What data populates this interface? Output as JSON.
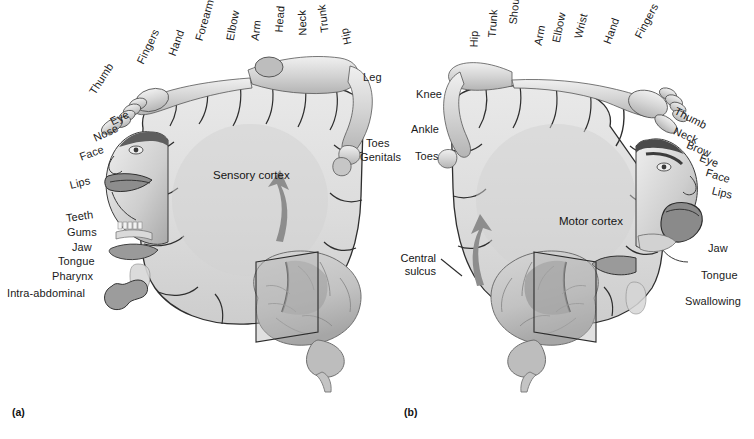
{
  "figure": {
    "background_color": "#ffffff",
    "width": 754,
    "height": 439
  },
  "panels": [
    {
      "id": "a",
      "letter": "(a)",
      "cortex_label": "Sensory cortex",
      "labels_top": [
        {
          "text": "Thumb",
          "x": 92,
          "y": 88,
          "rot": -57
        },
        {
          "text": "Fingers",
          "x": 140,
          "y": 58,
          "rot": -64
        },
        {
          "text": "Hand",
          "x": 172,
          "y": 50,
          "rot": -70
        },
        {
          "text": "Forearm",
          "x": 199,
          "y": 35,
          "rot": -74
        },
        {
          "text": "Elbow",
          "x": 230,
          "y": 35,
          "rot": -79
        },
        {
          "text": "Arm",
          "x": 255,
          "y": 35,
          "rot": -83
        },
        {
          "text": "Head",
          "x": 279,
          "y": 27,
          "rot": -86
        },
        {
          "text": "Neck",
          "x": 303,
          "y": 30,
          "rot": -92
        },
        {
          "text": "Trunk",
          "x": 325,
          "y": 27,
          "rot": -97
        },
        {
          "text": "Hip",
          "x": 348,
          "y": 39,
          "rot": -103
        }
      ],
      "labels_left": [
        {
          "text": "Eye",
          "x": 111,
          "y": 117,
          "rot": -27
        },
        {
          "text": "Nose",
          "x": 94,
          "y": 133,
          "rot": -24
        },
        {
          "text": "Face",
          "x": 80,
          "y": 152,
          "rot": -20
        },
        {
          "text": "Lips",
          "x": 70,
          "y": 180,
          "rot": -14
        },
        {
          "text": "Teeth",
          "x": 66,
          "y": 213,
          "rot": -8
        },
        {
          "text": "Gums",
          "x": 67,
          "y": 227,
          "rot": 0
        },
        {
          "text": "Jaw",
          "x": 72,
          "y": 242,
          "rot": 0
        },
        {
          "text": "Tongue",
          "x": 58,
          "y": 256,
          "rot": 0
        },
        {
          "text": "Pharynx",
          "x": 52,
          "y": 271,
          "rot": 0
        },
        {
          "text": "Intra-abdominal",
          "x": 7,
          "y": 288,
          "rot": 0
        }
      ],
      "labels_right": [
        {
          "text": "Leg",
          "x": 363,
          "y": 72,
          "rot": 0
        },
        {
          "text": "Toes",
          "x": 366,
          "y": 138,
          "rot": 0
        },
        {
          "text": "Genitals",
          "x": 360,
          "y": 152,
          "rot": 0
        }
      ]
    },
    {
      "id": "b",
      "letter": "(b)",
      "cortex_label": "Motor cortex",
      "callout": {
        "line1": "Central",
        "line2": "sulcus",
        "x": 404,
        "y": 258
      },
      "labels_top": [
        {
          "text": "Hip",
          "x": 474,
          "y": 42,
          "rot": -88
        },
        {
          "text": "Trunk",
          "x": 492,
          "y": 32,
          "rot": -86
        },
        {
          "text": "Shoulder",
          "x": 513,
          "y": 19,
          "rot": -84
        },
        {
          "text": "Arm",
          "x": 538,
          "y": 40,
          "rot": -80
        },
        {
          "text": "Elbow",
          "x": 556,
          "y": 37,
          "rot": -78
        },
        {
          "text": "Wrist",
          "x": 578,
          "y": 33,
          "rot": -76
        },
        {
          "text": "Hand",
          "x": 607,
          "y": 38,
          "rot": -70
        },
        {
          "text": "Fingers",
          "x": 638,
          "y": 32,
          "rot": -62
        }
      ],
      "labels_left": [
        {
          "text": "Knee",
          "x": 416,
          "y": 89,
          "rot": 0
        },
        {
          "text": "Ankle",
          "x": 411,
          "y": 124,
          "rot": 0
        },
        {
          "text": "Toes",
          "x": 415,
          "y": 151,
          "rot": 0
        }
      ],
      "labels_right": [
        {
          "text": "Thumb",
          "x": 675,
          "y": 105,
          "rot": 27
        },
        {
          "text": "Neck",
          "x": 674,
          "y": 125,
          "rot": 24
        },
        {
          "text": "Brow",
          "x": 687,
          "y": 139,
          "rot": 22
        },
        {
          "text": "Eye",
          "x": 700,
          "y": 152,
          "rot": 20
        },
        {
          "text": "Face",
          "x": 706,
          "y": 167,
          "rot": 17
        },
        {
          "text": "Lips",
          "x": 712,
          "y": 185,
          "rot": 14
        },
        {
          "text": "Jaw",
          "x": 708,
          "y": 243,
          "rot": 0
        },
        {
          "text": "Tongue",
          "x": 701,
          "y": 270,
          "rot": 0
        },
        {
          "text": "Swallowing",
          "x": 685,
          "y": 296,
          "rot": 0
        }
      ]
    }
  ],
  "colors": {
    "background": "#ffffff",
    "cortex_fill": "#dcdcdc",
    "cortex_fill_light": "#e6e6e6",
    "outline": "#2b2b2b",
    "body_fill": "#cfcfcf",
    "body_light": "#e8e8e8",
    "brain_fill": "#c9c9c9",
    "brain_shade": "#9e9e9e",
    "plane_fill": "#b8b8b8",
    "arrow_fill": "#8f8f8f",
    "text": "#1a1a1a"
  }
}
